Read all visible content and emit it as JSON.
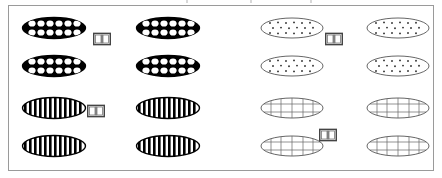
{
  "figure": {
    "canvas": {
      "width": 442,
      "height": 178,
      "background": "#ffffff"
    },
    "frame": {
      "border_color": "#9a9a9a",
      "border_width": 1,
      "fill": "#ffffff"
    },
    "colors": {
      "ink": "#000000",
      "frame": "#9a9a9a",
      "paper": "#ffffff",
      "thin_line": "#555555"
    },
    "icon_names": {
      "book": "open-book-icon",
      "ellipse": "ellipse-shape"
    },
    "groups": [
      {
        "id": "top-left",
        "position": "top-left",
        "pattern": "black-fill-white-dots",
        "pattern_label": "Solid black ellipse with white dot grid",
        "fill": "#000000",
        "dot_color": "#ffffff",
        "stroke": "#000000",
        "ellipse_count": 4,
        "rows": 2,
        "columns": 2,
        "dot_rows": 2,
        "dot_columns": 6,
        "marker": "open-book",
        "marker_count": 1
      },
      {
        "id": "bottom-left",
        "position": "bottom-left",
        "pattern": "vertical-stripes",
        "pattern_label": "White ellipse with vertical black stripes",
        "fill": "#ffffff",
        "stripe_color": "#000000",
        "stroke": "#000000",
        "ellipse_count": 4,
        "rows": 2,
        "columns": 2,
        "stripe_count": 13,
        "marker": "open-book",
        "marker_count": 1
      },
      {
        "id": "top-right",
        "position": "top-right",
        "pattern": "white-fill-black-dots",
        "pattern_label": "White ellipse with scattered small black dots",
        "fill": "#ffffff",
        "dot_color": "#333333",
        "stroke": "#555555",
        "ellipse_count": 4,
        "rows": 2,
        "columns": 2,
        "dot_rows": 3,
        "dot_columns": 6,
        "marker": "open-book",
        "marker_count": 1
      },
      {
        "id": "bottom-right",
        "position": "bottom-right",
        "pattern": "grid-crosshatch",
        "pattern_label": "White ellipse with thin grid crosshatch",
        "fill": "#ffffff",
        "line_color": "#555555",
        "stroke": "#555555",
        "ellipse_count": 4,
        "rows": 2,
        "columns": 2,
        "grid_vertical_lines": 5,
        "grid_horizontal_lines": 2,
        "marker": "open-book",
        "marker_count": 1
      }
    ]
  }
}
